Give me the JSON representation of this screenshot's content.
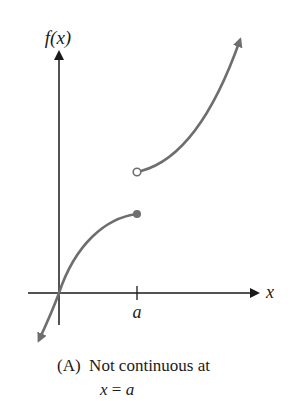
{
  "diagram": {
    "y_axis_label": "f(x)",
    "x_axis_label": "x",
    "tick_label": "a",
    "curve_color": "#6e6e6e",
    "axis_color": "#1a1a1a",
    "discontinuity": {
      "open_point": "open circle at x = a (upper branch)",
      "closed_point": "filled dot at x = a (lower branch)"
    }
  },
  "caption": {
    "marker": "(A)",
    "line1": "Not continuous at",
    "line2_var": "x",
    "line2_eq": " = ",
    "line2_val": "a"
  }
}
